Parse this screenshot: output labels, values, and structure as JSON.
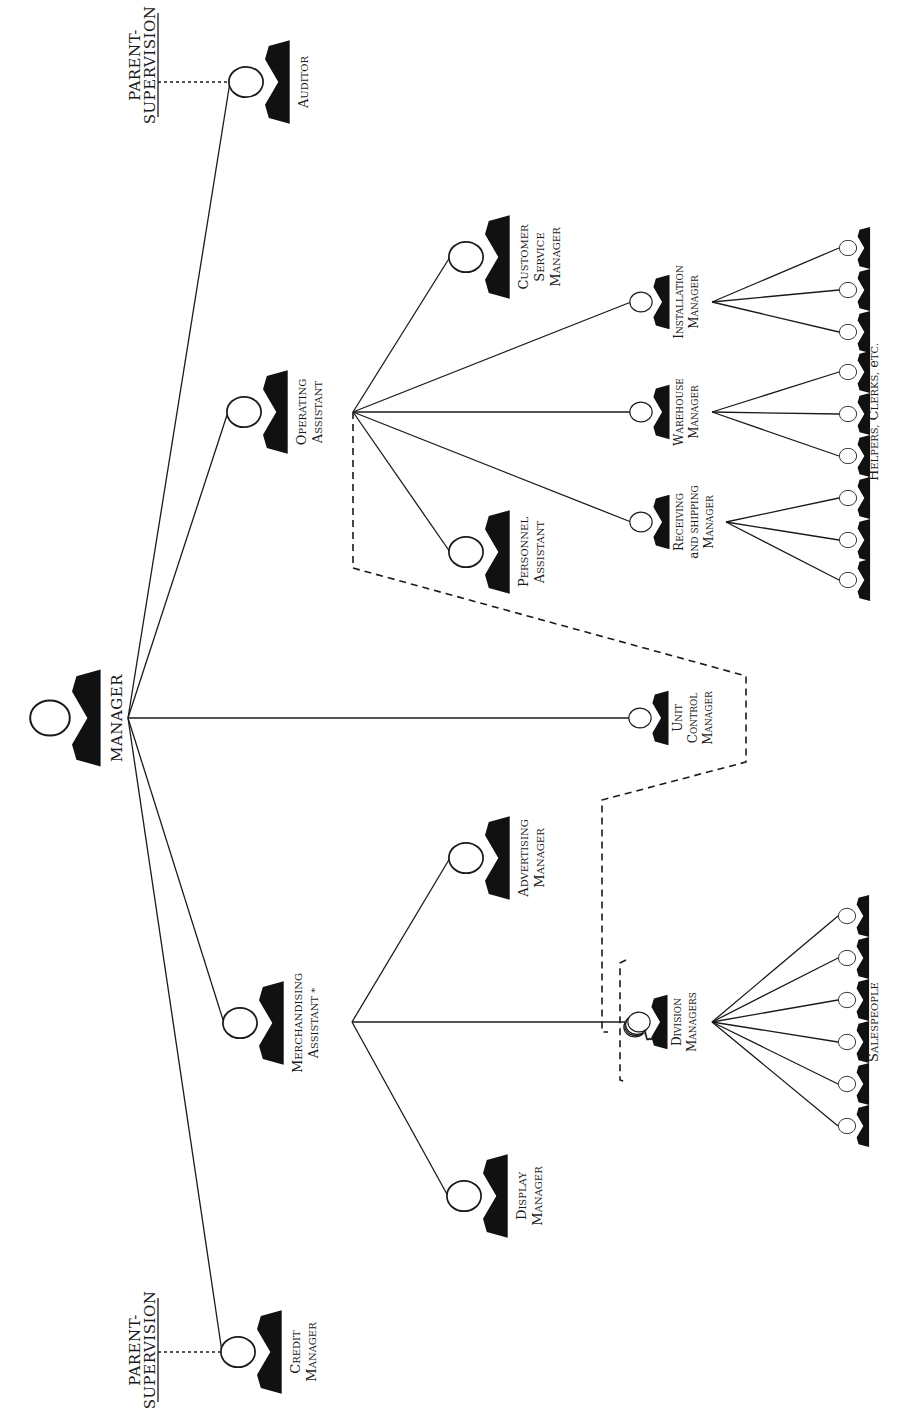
{
  "diagram": {
    "orientation": "rotated-90-clockwise",
    "ink_color": "#1a1a1a",
    "background": "#ffffff",
    "root": {
      "id": "manager",
      "label": "MANAGER",
      "cx": 50,
      "cy": 718,
      "size": "large"
    },
    "parent_supervision": [
      {
        "id": "ps-top",
        "line1": "PARENT-",
        "line2": "SUPERVISION",
        "x": 158,
        "y": 65,
        "link_to": "auditor"
      },
      {
        "id": "ps-bottom",
        "line1": "PARENT-",
        "line2": "SUPERVISION",
        "x": 158,
        "y": 1350,
        "link_to": "credit-manager"
      }
    ],
    "nodes": [
      {
        "id": "auditor",
        "lines": [
          "Auditor"
        ],
        "cx": 246,
        "cy": 82,
        "parent": "manager"
      },
      {
        "id": "operating-assistant",
        "lines": [
          "Operating",
          "Assistant"
        ],
        "cx": 244,
        "cy": 412,
        "parent": "manager"
      },
      {
        "id": "unit-control-manager",
        "lines": [
          "Unit",
          "Control",
          "Manager"
        ],
        "cx": 640,
        "cy": 718,
        "parent": "manager",
        "small": true
      },
      {
        "id": "merchandising-assistant",
        "lines": [
          "Merchandising",
          "Assistant *"
        ],
        "cx": 240,
        "cy": 1023,
        "parent": "manager"
      },
      {
        "id": "credit-manager",
        "lines": [
          "Credit",
          "Manager"
        ],
        "cx": 238,
        "cy": 1352,
        "parent": "manager"
      },
      {
        "id": "customer-service-manager",
        "lines": [
          "Customer",
          "Service",
          "Manager"
        ],
        "cx": 466,
        "cy": 257,
        "parent": "operating-assistant"
      },
      {
        "id": "personnel-assistant",
        "lines": [
          "Personnel",
          "Assistant"
        ],
        "cx": 466,
        "cy": 552,
        "parent": "operating-assistant"
      },
      {
        "id": "installation-manager",
        "lines": [
          "Installation",
          "Manager"
        ],
        "cx": 641,
        "cy": 302,
        "parent": "operating-assistant",
        "small": true
      },
      {
        "id": "warehouse-manager",
        "lines": [
          "Warehouse",
          "Manager"
        ],
        "cx": 641,
        "cy": 412,
        "parent": "operating-assistant",
        "small": true
      },
      {
        "id": "receiving-shipping-manager",
        "lines": [
          "Receiving",
          "and Shipping",
          "Manager"
        ],
        "cx": 641,
        "cy": 522,
        "parent": "operating-assistant",
        "small": true
      },
      {
        "id": "advertising-manager",
        "lines": [
          "Advertising",
          "Manager"
        ],
        "cx": 466,
        "cy": 858,
        "parent": "merchandising-assistant"
      },
      {
        "id": "division-managers",
        "lines": [
          "Division",
          "Managers"
        ],
        "cx": 639,
        "cy": 1022,
        "parent": "merchandising-assistant",
        "small": true,
        "stacked": true
      },
      {
        "id": "display-manager",
        "lines": [
          "Display",
          "Manager"
        ],
        "cx": 464,
        "cy": 1196,
        "parent": "merchandising-assistant"
      }
    ],
    "branch_points": {
      "manager": {
        "x": 128,
        "y": 718
      },
      "operating-assistant": {
        "x": 353,
        "y": 412
      },
      "merchandising-assistant": {
        "x": 352,
        "y": 1022
      },
      "installation-manager": {
        "x": 712,
        "y": 302
      },
      "warehouse-manager": {
        "x": 712,
        "y": 412
      },
      "receiving-shipping-manager": {
        "x": 726,
        "y": 522
      },
      "division-managers": {
        "x": 712,
        "y": 1022
      }
    },
    "worker_groups": [
      {
        "id": "helpers",
        "label": "Helpers, Clerks, etc.",
        "label_x": 878,
        "label_y": 412,
        "workers": [
          {
            "cx": 848,
            "cy": 248,
            "parent": "installation-manager"
          },
          {
            "cx": 848,
            "cy": 290,
            "parent": "installation-manager"
          },
          {
            "cx": 848,
            "cy": 332,
            "parent": "installation-manager"
          },
          {
            "cx": 848,
            "cy": 372,
            "parent": "warehouse-manager"
          },
          {
            "cx": 848,
            "cy": 414,
            "parent": "warehouse-manager"
          },
          {
            "cx": 848,
            "cy": 456,
            "parent": "warehouse-manager"
          },
          {
            "cx": 848,
            "cy": 498,
            "parent": "receiving-shipping-manager"
          },
          {
            "cx": 848,
            "cy": 540,
            "parent": "receiving-shipping-manager"
          },
          {
            "cx": 848,
            "cy": 580,
            "parent": "receiving-shipping-manager"
          }
        ]
      },
      {
        "id": "salespeople",
        "label": "Salespeople",
        "label_x": 878,
        "label_y": 1022,
        "workers": [
          {
            "cx": 847,
            "cy": 916,
            "parent": "division-managers"
          },
          {
            "cx": 847,
            "cy": 958,
            "parent": "division-managers"
          },
          {
            "cx": 847,
            "cy": 1000,
            "parent": "division-managers"
          },
          {
            "cx": 847,
            "cy": 1042,
            "parent": "division-managers"
          },
          {
            "cx": 847,
            "cy": 1084,
            "parent": "division-managers"
          },
          {
            "cx": 847,
            "cy": 1126,
            "parent": "division-managers"
          }
        ]
      }
    ],
    "dashed_path": {
      "description": "Unit Control functional link from Operating Assistant to Division Managers",
      "points": [
        [
          353,
          412
        ],
        [
          353,
          568
        ],
        [
          746,
          676
        ],
        [
          746,
          762
        ],
        [
          602,
          800
        ],
        [
          602,
          1032
        ],
        [
          608,
          1032
        ]
      ]
    },
    "division_bracket": {
      "points": [
        [
          626,
          960
        ],
        [
          620,
          963
        ],
        [
          620,
          1080
        ],
        [
          626,
          1082
        ]
      ]
    }
  }
}
